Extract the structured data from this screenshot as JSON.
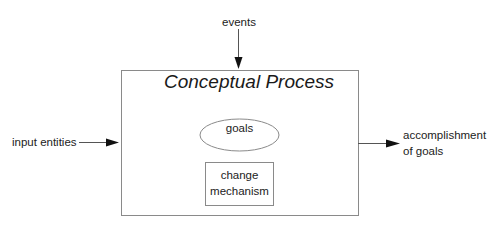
{
  "diagram": {
    "title": "Conceptual Process",
    "top_input": "events",
    "left_input": "input entities",
    "right_output_line1": "accomplishment",
    "right_output_line2": "of goals",
    "inner_ellipse": "goals",
    "inner_box_line1": "change",
    "inner_box_line2": "mechanism",
    "colors": {
      "line": "#555555",
      "arrowhead": "#111111",
      "text": "#222222",
      "background": "#ffffff"
    }
  }
}
